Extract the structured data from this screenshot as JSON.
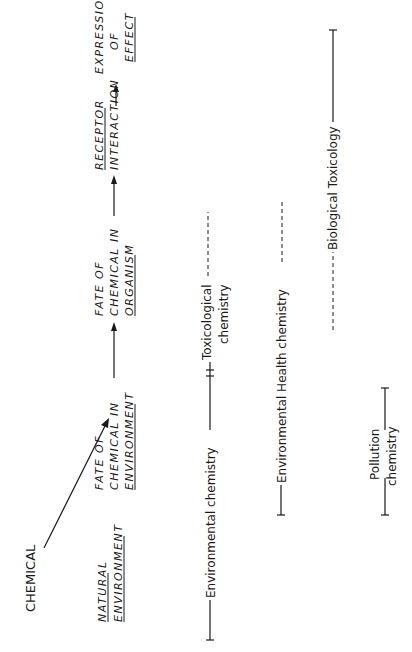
{
  "diagram": {
    "orientation": "rotated 90 degrees counter-clockwise",
    "flow": {
      "source": "CHEMICAL",
      "stages": [
        {
          "lines": [
            "NATURAL",
            "ENVIRONMENT"
          ],
          "underlined": [
            "NATURAL",
            "ENVIRONMENT"
          ]
        },
        {
          "lines": [
            "FATE OF",
            "CHEMICAL IN",
            "ENVIRONMENT"
          ],
          "underlined": [
            "ENVIRONMENT"
          ]
        },
        {
          "lines": [
            "FATE OF",
            "CHEMICAL IN",
            "ORGANISM"
          ],
          "underlined": [
            "ORGANISM"
          ]
        },
        {
          "lines": [
            "RECEPTOR",
            "INTERACTION"
          ],
          "underlined": [
            "RECEPTOR"
          ]
        },
        {
          "lines": [
            "EXPRESSION",
            "OF",
            "EFFECT"
          ],
          "underlined": [
            "EFFECT"
          ]
        }
      ]
    },
    "disciplines": [
      {
        "label": "Environmental chemistry",
        "span_style": "solid"
      },
      {
        "label_line1": "Toxicological",
        "label_line2": "chemistry",
        "span_style": "dashed"
      },
      {
        "label": "Environmental  Health chemistry",
        "span_style": "solid-then-dashed"
      },
      {
        "label": "Biological  Toxicology",
        "span_style": "dashed-then-solid"
      },
      {
        "label_line1": "Pollution",
        "label_line2": "chemistry",
        "span_style": "solid"
      }
    ]
  }
}
